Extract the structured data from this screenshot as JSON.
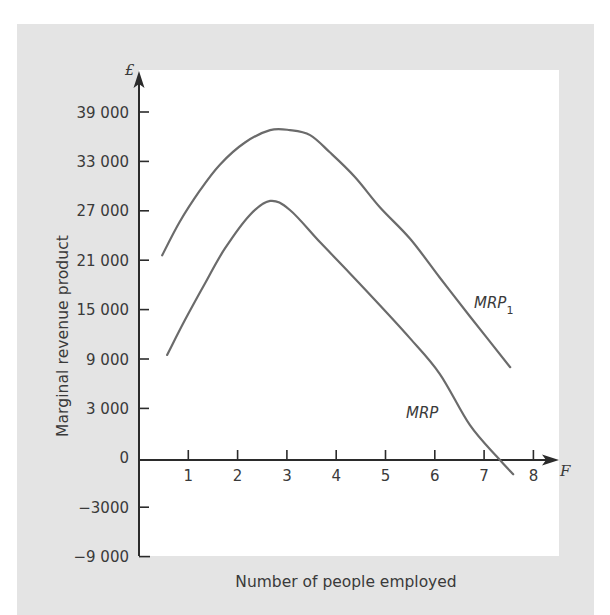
{
  "chart_data": {
    "type": "line",
    "title": "",
    "xlabel": "Number of people employed",
    "ylabel": "Marginal revenue product",
    "x_axis_symbol": "F",
    "y_axis_symbol": "£",
    "x_ticks": [
      1,
      2,
      3,
      4,
      5,
      6,
      7,
      8
    ],
    "x_tick_labels": [
      "1",
      "2",
      "3",
      "4",
      "5",
      "6",
      "7",
      "8"
    ],
    "y_ticks": [
      39000,
      33000,
      27000,
      21000,
      15000,
      9000,
      3000,
      0,
      -3000,
      -9000
    ],
    "y_tick_labels": [
      "39 000",
      "33 000",
      "27 000",
      "21 000",
      "15 000",
      "9 000",
      "3 000",
      "0",
      "−3000",
      "−9 000"
    ],
    "xlim": [
      0,
      8.5
    ],
    "ylim": [
      -9000,
      39000
    ],
    "grid": false,
    "legend": "none (curves labelled directly)",
    "series": [
      {
        "name": "MRP1",
        "label": "MRP",
        "label_sub": "1",
        "points": [
          [
            0.47,
            21600
          ],
          [
            0.83,
            25700
          ],
          [
            1.24,
            29500
          ],
          [
            1.64,
            32600
          ],
          [
            2.15,
            35300
          ],
          [
            2.66,
            36800
          ],
          [
            3.06,
            36800
          ],
          [
            3.47,
            36200
          ],
          [
            3.87,
            34100
          ],
          [
            4.38,
            31100
          ],
          [
            4.89,
            27400
          ],
          [
            5.5,
            23600
          ],
          [
            6.1,
            18900
          ],
          [
            6.71,
            14200
          ],
          [
            7.53,
            8000
          ]
        ]
      },
      {
        "name": "MRP",
        "label": "MRP",
        "label_sub": "",
        "points": [
          [
            0.57,
            9500
          ],
          [
            0.93,
            13700
          ],
          [
            1.34,
            18200
          ],
          [
            1.74,
            22400
          ],
          [
            2.25,
            26500
          ],
          [
            2.66,
            28200
          ],
          [
            3.06,
            27100
          ],
          [
            3.67,
            23200
          ],
          [
            4.28,
            19400
          ],
          [
            4.89,
            15500
          ],
          [
            5.5,
            11500
          ],
          [
            6.1,
            7200
          ],
          [
            6.71,
            2000
          ],
          [
            7.28,
            0
          ],
          [
            7.59,
            -1000
          ]
        ]
      }
    ]
  },
  "colors": {
    "frame_background": "#e4e4e4",
    "plot_background": "#ffffff",
    "axis": "#2b2b2b",
    "curve": "#6b6b6b",
    "text": "#3a3a3a"
  }
}
